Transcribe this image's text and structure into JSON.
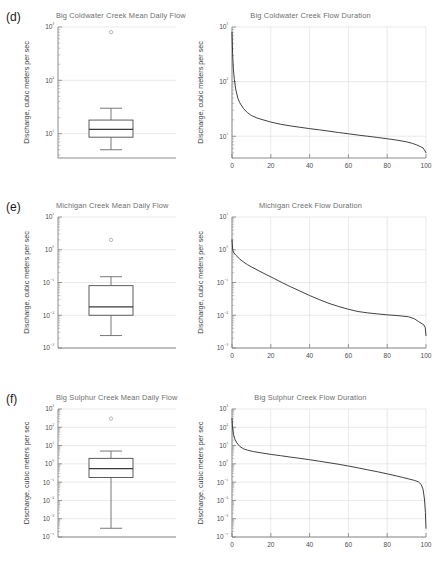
{
  "figure": {
    "axis_label_y": "Discharge, cubic meters per sec",
    "panel_labels": [
      "(d)",
      "(e)",
      "(f)"
    ]
  },
  "chart_data": [
    {
      "type": "box",
      "panel": "d",
      "title": "Big Coldwater Creek Mean Daily Flow",
      "ylabel": "Discharge, cubic meters per sec",
      "xlabel": "",
      "ylim": [
        3.5,
        1000
      ],
      "ytick_labels": [
        "10³",
        "10²",
        "10¹"
      ],
      "ytick_values": [
        1000,
        100,
        10
      ],
      "grid": true,
      "box": {
        "whisker_low": 5.0,
        "q1": 8.6,
        "median": 12.0,
        "q3": 18.0,
        "whisker_high": 30.0,
        "outliers": [
          800
        ]
      }
    },
    {
      "type": "line",
      "panel": "d",
      "title": "Big Coldwater Creek Flow Duration",
      "ylabel": "Discharge, cubic meters per sec",
      "xlabel": "",
      "xlim": [
        0,
        100
      ],
      "ylim": [
        4.0,
        1000
      ],
      "xtick_labels": [
        "0",
        "20",
        "40",
        "60",
        "80",
        "100"
      ],
      "xtick_values": [
        0,
        20,
        40,
        60,
        80,
        100
      ],
      "ytick_labels": [
        "10³",
        "10²",
        "10¹"
      ],
      "ytick_values": [
        1000,
        100,
        10
      ],
      "grid": true,
      "x": [
        0,
        0.3,
        0.7,
        1.2,
        2,
        3,
        4,
        6,
        8,
        10,
        13,
        16,
        20,
        25,
        30,
        35,
        40,
        45,
        50,
        55,
        60,
        65,
        70,
        75,
        80,
        85,
        90,
        93,
        95,
        97,
        98.5,
        99.5,
        100
      ],
      "y": [
        800,
        330,
        170,
        110,
        70,
        50,
        41,
        32,
        27,
        24,
        21.5,
        20,
        18.2,
        16.6,
        15.5,
        14.6,
        13.8,
        13.1,
        12.4,
        11.7,
        11.1,
        10.5,
        10.0,
        9.5,
        9.0,
        8.5,
        7.9,
        7.4,
        7.0,
        6.5,
        6.1,
        5.4,
        5.0
      ]
    },
    {
      "type": "box",
      "panel": "e",
      "title": "Michigan Creek Mean Daily Flow",
      "ylabel": "Discharge, cubic meters per sec",
      "xlabel": "",
      "ylim": [
        0.001,
        10
      ],
      "ytick_labels": [
        "10¹",
        "10⁰",
        "10⁻¹",
        "10⁻²",
        "10⁻³"
      ],
      "ytick_values": [
        10,
        1,
        0.1,
        0.01,
        0.001
      ],
      "grid": true,
      "box": {
        "whisker_low": 0.0024,
        "q1": 0.01,
        "median": 0.018,
        "q3": 0.08,
        "whisker_high": 0.15,
        "outliers": [
          2.0
        ]
      }
    },
    {
      "type": "line",
      "panel": "e",
      "title": "Michigan Creek Flow Duration",
      "ylabel": "Discharge, cubic meters per sec",
      "xlabel": "",
      "xlim": [
        0,
        100
      ],
      "ylim": [
        0.001,
        10
      ],
      "xtick_labels": [
        "0",
        "20",
        "40",
        "60",
        "80",
        "100"
      ],
      "xtick_values": [
        0,
        20,
        40,
        60,
        80,
        100
      ],
      "ytick_labels": [
        "10¹",
        "10⁰",
        "10⁻¹",
        "10⁻²",
        "10⁻³"
      ],
      "ytick_values": [
        10,
        1,
        0.1,
        0.01,
        0.001
      ],
      "grid": true,
      "x": [
        0,
        0.4,
        1,
        2,
        4,
        6,
        8,
        10,
        14,
        18,
        22,
        26,
        30,
        35,
        40,
        45,
        50,
        55,
        60,
        65,
        70,
        75,
        80,
        85,
        88,
        91,
        94,
        96,
        98,
        99,
        99.6,
        100
      ],
      "y": [
        2.0,
        0.95,
        0.8,
        0.68,
        0.52,
        0.42,
        0.35,
        0.3,
        0.225,
        0.17,
        0.13,
        0.098,
        0.075,
        0.055,
        0.04,
        0.03,
        0.023,
        0.0185,
        0.0152,
        0.013,
        0.0118,
        0.011,
        0.0103,
        0.0098,
        0.0094,
        0.009,
        0.0078,
        0.0065,
        0.0055,
        0.005,
        0.0042,
        0.0024
      ]
    },
    {
      "type": "box",
      "panel": "f",
      "title": "Big Sulphur Creek Mean Daily Flow",
      "ylabel": "Discharge, cubic meters per sec",
      "xlabel": "",
      "ylim": [
        0.0001,
        1000
      ],
      "ytick_labels": [
        "10³",
        "10²",
        "10¹",
        "10⁰",
        "10⁻¹",
        "10⁻²",
        "10⁻³",
        "10⁻⁴"
      ],
      "ytick_values": [
        1000,
        100,
        10,
        1,
        0.1,
        0.01,
        0.001,
        0.0001
      ],
      "grid": true,
      "box": {
        "whisker_low": 0.0003,
        "q1": 0.18,
        "median": 0.55,
        "q3": 2.0,
        "whisker_high": 5.0,
        "outliers": [
          300
        ]
      }
    },
    {
      "type": "line",
      "panel": "f",
      "title": "Big Sulphur Creek Flow Duration",
      "ylabel": "Discharge, cubic meters per sec",
      "xlabel": "",
      "xlim": [
        0,
        100
      ],
      "ylim": [
        0.0001,
        1000
      ],
      "xtick_labels": [
        "0",
        "20",
        "40",
        "60",
        "80",
        "100"
      ],
      "xtick_values": [
        0,
        20,
        40,
        60,
        80,
        100
      ],
      "ytick_labels": [
        "10³",
        "10²",
        "10¹",
        "10⁰",
        "10⁻¹",
        "10⁻²",
        "10⁻³",
        "10⁻⁴"
      ],
      "ytick_values": [
        1000,
        100,
        10,
        1,
        0.1,
        0.01,
        0.001,
        0.0001
      ],
      "grid": true,
      "x": [
        0,
        0.3,
        0.8,
        1.5,
        2.5,
        4,
        6,
        8,
        11,
        15,
        20,
        25,
        30,
        35,
        40,
        45,
        50,
        55,
        60,
        65,
        70,
        75,
        80,
        85,
        88,
        91,
        94,
        96,
        97.5,
        98.5,
        99.2,
        99.7,
        100
      ],
      "y": [
        300,
        90,
        40,
        22,
        14,
        9.0,
        6.6,
        5.6,
        4.7,
        4.0,
        3.3,
        2.8,
        2.35,
        2.0,
        1.68,
        1.4,
        1.15,
        0.95,
        0.76,
        0.6,
        0.47,
        0.37,
        0.285,
        0.215,
        0.18,
        0.15,
        0.125,
        0.105,
        0.075,
        0.04,
        0.012,
        0.0022,
        0.0003
      ]
    }
  ]
}
